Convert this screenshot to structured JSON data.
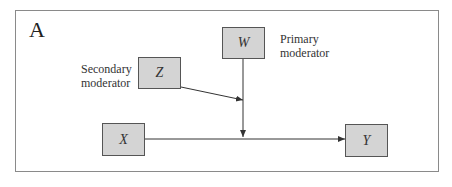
{
  "diagram": {
    "panel_label": "A",
    "nodes": {
      "W": {
        "label": "W",
        "caption_line1": "Primary",
        "caption_line2": "moderator"
      },
      "Z": {
        "label": "Z",
        "caption_line1": "Secondary",
        "caption_line2": "moderator"
      },
      "X": {
        "label": "X"
      },
      "Y": {
        "label": "Y"
      }
    },
    "edges": [
      {
        "from": "X",
        "to": "Y",
        "type": "arrow"
      },
      {
        "from": "W",
        "to": "X->Y path",
        "type": "arrow"
      },
      {
        "from": "Z",
        "to": "W->path line",
        "type": "arrow"
      }
    ],
    "colors": {
      "box_fill": "#d4d4d4",
      "box_border": "#555555",
      "line": "#333333",
      "frame": "#8a8a8a"
    }
  }
}
